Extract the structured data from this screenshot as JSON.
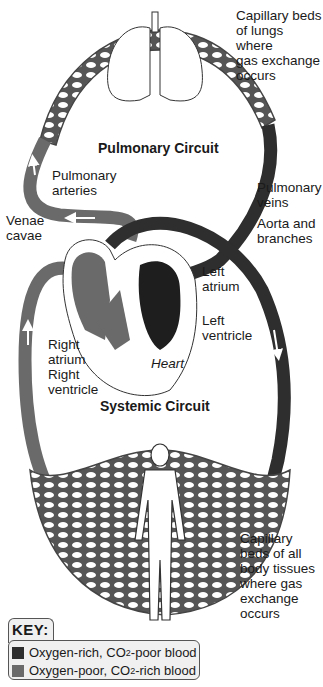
{
  "titles": {
    "pulmonary": "Pulmonary Circuit",
    "systemic": "Systemic Circuit",
    "heart": "Heart"
  },
  "labels": {
    "lung_capillaries": "Capillary beds\nof lungs where\ngas exchange\noccurs",
    "pulmonary_arteries": "Pulmonary\narteries",
    "pulmonary_veins": "Pulmonary\nveins",
    "aorta": "Aorta and\nbranches",
    "venae_cavae": "Venae\ncavae",
    "left_atrium": "Left\natrium",
    "left_ventricle": "Left\nventricle",
    "right_atrium": "Right\natrium",
    "right_ventricle": "Right\nventricle",
    "body_capillaries": "Capillary\nbeds of all\nbody tissues\nwhere gas\nexchange\noccurs"
  },
  "key": {
    "title": "KEY:",
    "items": [
      {
        "pre": "Oxygen-rich, CO",
        "sub": "2",
        "post": "-poor blood",
        "color": "#2e2e2e"
      },
      {
        "pre": "Oxygen-poor, CO",
        "sub": "2",
        "post": "-rich blood",
        "color": "#6a6a6a"
      }
    ]
  },
  "colors": {
    "oxygen_rich": "#2e2e2e",
    "oxygen_poor": "#6a6a6a",
    "capillary": "#5a5a5a"
  }
}
